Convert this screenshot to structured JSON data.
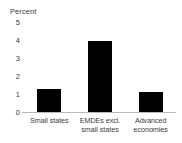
{
  "chart_data": {
    "type": "bar",
    "title": "",
    "ylabel": "Percent",
    "xlabel": "",
    "categories": [
      "Small states",
      "EMDEs excl. small states",
      "Advanced economies"
    ],
    "category_lines": [
      [
        "Small states"
      ],
      [
        "EMDEs excl.",
        "small states"
      ],
      [
        "Advanced",
        "economies"
      ]
    ],
    "values": [
      1.3,
      4.0,
      1.15
    ],
    "ylim": [
      0,
      5
    ],
    "yticks": [
      5,
      4,
      3,
      2,
      1,
      0
    ],
    "ytick_labels": [
      "5",
      "4",
      "3",
      "2",
      "1",
      "0"
    ],
    "grid": false,
    "legend": null,
    "bar_color": "#000000",
    "axis_color": "#b9b9b9",
    "text_color": "#3b3b3b",
    "background_color": "#ffffff"
  }
}
